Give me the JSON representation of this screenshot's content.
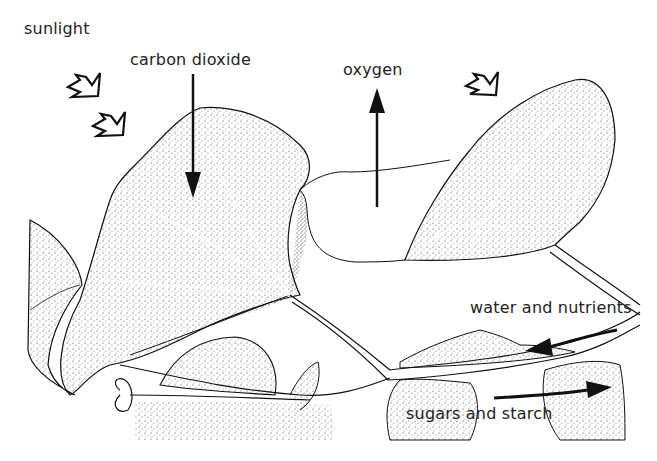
{
  "diagram": {
    "labels": {
      "sunlight": "sunlight",
      "carbon_dioxide": "carbon dioxide",
      "oxygen": "oxygen",
      "water_and_nutrients": "water and nutrients",
      "sugars_and_starch": "sugars and starch"
    },
    "arrows": [
      {
        "name": "sunlight",
        "direction": "down-right",
        "count": 3,
        "style": "outlined"
      },
      {
        "name": "carbon-dioxide",
        "direction": "down",
        "into": "leaf"
      },
      {
        "name": "oxygen",
        "direction": "up",
        "out_of": "leaf"
      },
      {
        "name": "water-and-nutrients",
        "direction": "left",
        "along": "stem"
      },
      {
        "name": "sugars-and-starch",
        "direction": "right",
        "along": "stem"
      }
    ],
    "colors": {
      "ink": "#111111",
      "background": "#ffffff"
    }
  }
}
